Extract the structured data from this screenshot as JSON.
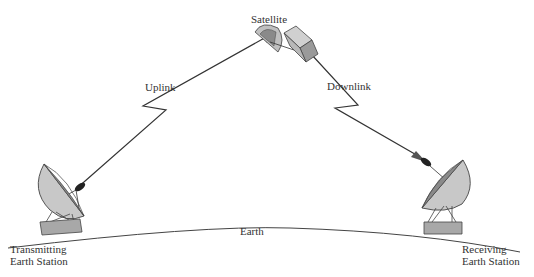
{
  "diagram": {
    "labels": {
      "satellite": "Satellite",
      "uplink": "Uplink",
      "downlink": "Downlink",
      "earth": "Earth",
      "transmitting_line1": "Transmitting",
      "transmitting_line2": "Earth Station",
      "receiving_line1": "Receiving",
      "receiving_line2": "Earth Station"
    },
    "colors": {
      "line": "#333333",
      "dish_light": "#c8c8c8",
      "dish_dark": "#8a8a8a",
      "base": "#a0a0a0"
    }
  }
}
